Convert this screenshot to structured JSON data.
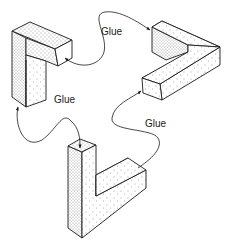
{
  "diagram": {
    "type": "assembly-illustration",
    "colors": {
      "background": "#ffffff",
      "stroke": "#1a1a1a",
      "face_light": "#f4f4f4",
      "face_dark": "#d9d9d9"
    },
    "labels": {
      "glue_top": "Glue",
      "glue_left": "Glue",
      "glue_right": "Glue"
    },
    "pieces": [
      {
        "id": "piece-a",
        "position": "top-left",
        "shape": "L-block upright"
      },
      {
        "id": "piece-b",
        "position": "top-right",
        "shape": "V-block horizontal"
      },
      {
        "id": "piece-c",
        "position": "bottom-center",
        "shape": "L-block upright"
      }
    ],
    "connections": [
      {
        "from": "piece-a end",
        "to": "piece-b end",
        "label": "Glue"
      },
      {
        "from": "piece-a bottom",
        "to": "piece-c top",
        "label": "Glue"
      },
      {
        "from": "piece-c end",
        "to": "piece-b end",
        "label": "Glue"
      }
    ]
  }
}
